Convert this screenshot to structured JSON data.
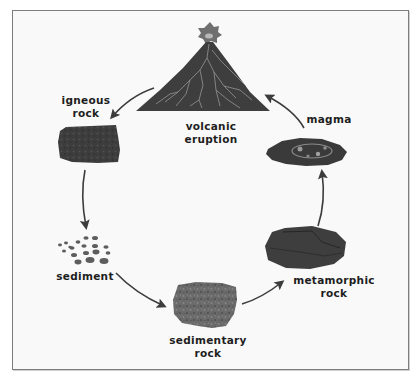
{
  "diagram": {
    "colors": {
      "rock_dark": "#3a3a3a",
      "rock_mid": "#555555",
      "vein": "#9a9a9a",
      "arrow": "#3c3c3c",
      "frame_border": "#7d7d7d",
      "background": "#f9f9f9"
    },
    "nodes": [
      {
        "id": "volcanic-eruption",
        "label_line1": "volcanic",
        "label_line2": "eruption",
        "icon": "volcano-icon"
      },
      {
        "id": "igneous-rock",
        "label_line1": "igneous",
        "label_line2": "rock",
        "icon": "igneous-rock-icon"
      },
      {
        "id": "sediment",
        "label_line1": "sediment",
        "label_line2": "",
        "icon": "sediment-pebbles-icon"
      },
      {
        "id": "sedimentary-rock",
        "label_line1": "sedimentary",
        "label_line2": "rock",
        "icon": "sedimentary-rock-icon"
      },
      {
        "id": "metamorphic-rock",
        "label_line1": "metamorphic",
        "label_line2": "rock",
        "icon": "metamorphic-rock-icon"
      },
      {
        "id": "magma",
        "label_line1": "magma",
        "label_line2": "",
        "icon": "magma-icon"
      }
    ],
    "edges": [
      {
        "from": "volcanic-eruption",
        "to": "igneous-rock"
      },
      {
        "from": "igneous-rock",
        "to": "sediment"
      },
      {
        "from": "sediment",
        "to": "sedimentary-rock"
      },
      {
        "from": "sedimentary-rock",
        "to": "metamorphic-rock"
      },
      {
        "from": "metamorphic-rock",
        "to": "magma"
      },
      {
        "from": "magma",
        "to": "volcanic-eruption"
      }
    ]
  }
}
